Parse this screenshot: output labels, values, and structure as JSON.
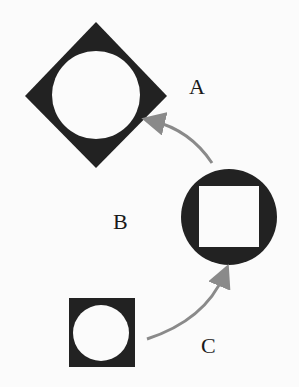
{
  "diagram": {
    "labels": {
      "a": "A",
      "b": "B",
      "c": "C"
    },
    "shapes": {
      "a": {
        "outer": "diamond",
        "inner": "circle"
      },
      "b": {
        "outer": "circle",
        "inner": "square"
      },
      "c": {
        "outer": "square",
        "inner": "circle"
      }
    },
    "arrows": [
      {
        "from": "C",
        "to": "B"
      },
      {
        "from": "B",
        "to": "A"
      }
    ],
    "colors": {
      "shape_fill": "#222222",
      "hole_fill": "#fbfbfb",
      "arrow": "#8a8a8a"
    }
  }
}
